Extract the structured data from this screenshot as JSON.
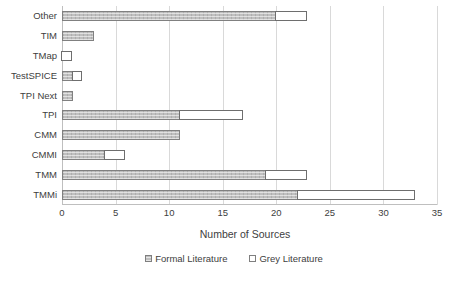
{
  "chart_data": {
    "type": "bar",
    "orientation": "horizontal",
    "stacked": true,
    "title": "",
    "xlabel": "Number of Sources",
    "ylabel": "",
    "xlim": [
      0,
      35
    ],
    "xticks": [
      0,
      5,
      10,
      15,
      20,
      25,
      30,
      35
    ],
    "grid": "vertical",
    "legend_position": "bottom",
    "categories": [
      "Other",
      "TIM",
      "TMap",
      "TestSPICE",
      "TPI Next",
      "TPI",
      "CMM",
      "CMMI",
      "TMM",
      "TMMi"
    ],
    "series": [
      {
        "name": "Formal Literature",
        "color": "#BFBFBF",
        "values": [
          20,
          3,
          0,
          1,
          1,
          11,
          11,
          4,
          19,
          22
        ]
      },
      {
        "name": "Grey Literature",
        "color": "#FFFFFF",
        "values": [
          3,
          0,
          1,
          1,
          0,
          6,
          0,
          2,
          4,
          11
        ]
      }
    ],
    "totals": [
      23,
      3,
      1,
      2,
      1,
      17,
      11,
      6,
      23,
      33
    ]
  },
  "axis": {
    "tick_labels": [
      "0",
      "5",
      "10",
      "15",
      "20",
      "25",
      "30",
      "35"
    ],
    "x_title": "Number of Sources"
  },
  "legend": {
    "items": [
      {
        "label": "Formal Literature",
        "swatch": "formal-literature-swatch"
      },
      {
        "label": "Grey Literature",
        "swatch": "grey-literature-swatch"
      }
    ]
  }
}
